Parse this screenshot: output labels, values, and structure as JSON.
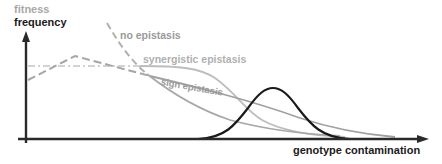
{
  "figure": {
    "y_axis": {
      "label_top": "fitness",
      "label_bottom": "frequency"
    },
    "x_axis": {
      "label": "genotype contamination"
    },
    "curves": [
      {
        "name": "no epistasis",
        "style": "dashed-then-solid",
        "color": "#a8a8a8"
      },
      {
        "name": "synergistic epistasis",
        "style": "dash-dot-then-solid",
        "color": "#bdbdbd"
      },
      {
        "name": "sign epistasis",
        "style": "dashed-then-solid",
        "color": "#9e9e9e"
      },
      {
        "name": "frequency distribution",
        "style": "solid",
        "color": "#1a1a1a"
      }
    ],
    "colors": {
      "axis": "#2a2a2a",
      "frequency_curve": "#1a1a1a",
      "no_epistasis": "#a8a8a8",
      "synergistic_epistasis": "#bdbdbd",
      "sign_epistasis": "#9e9e9e"
    }
  }
}
